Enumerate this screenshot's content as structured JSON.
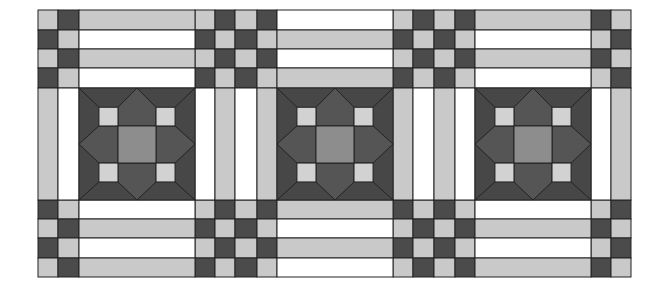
{
  "diagram": {
    "type": "quilt-pattern"
  },
  "colors": {
    "white": "#ffffff",
    "light": "#c9c9c9",
    "dark": "#4b4b4b",
    "block_bg": "#474747",
    "arrow": "#555555",
    "center": "#8d8d8d",
    "small_square": "#d2d2d2",
    "line": "#222222"
  },
  "grid": {
    "x": [
      38,
      58,
      79,
      195,
      215,
      235,
      257,
      277,
      393,
      413,
      434,
      455,
      475,
      591,
      611,
      631
    ],
    "y": [
      10,
      30,
      49,
      68,
      88,
      200,
      219,
      238,
      258,
      277
    ]
  },
  "layout": {
    "four_patch_columns": [
      {
        "name": "left-edge",
        "cols": [
          0,
          1
        ],
        "first_row_pattern": [
          "light",
          "dark"
        ]
      },
      {
        "name": "between-1-2",
        "cols": [
          3,
          4,
          5,
          6
        ],
        "first_row_pattern": [
          "light",
          "dark",
          "light",
          "dark"
        ]
      },
      {
        "name": "between-2-3",
        "cols": [
          8,
          9,
          10,
          11
        ],
        "first_row_pattern": [
          "light",
          "dark",
          "light",
          "dark"
        ]
      },
      {
        "name": "right-edge",
        "cols": [
          13,
          14
        ],
        "first_row_pattern": [
          "dark",
          "light"
        ]
      }
    ],
    "bottom_first_row_pattern_left": [
      "dark",
      "light"
    ],
    "bottom_first_row_pattern_between_1_2": [
      "light",
      "dark",
      "light",
      "dark"
    ],
    "bottom_first_row_pattern_between_2_3": [
      "dark",
      "light",
      "dark",
      "light"
    ],
    "bottom_first_row_pattern_right": [
      "light",
      "dark"
    ],
    "middle_strips": {
      "left-edge": [
        "light",
        "white"
      ],
      "between-1-2": [
        "white",
        "light",
        "white",
        "light"
      ],
      "between-2-3": [
        "light",
        "white",
        "light",
        "white"
      ],
      "right-edge": [
        "white",
        "light"
      ]
    },
    "blocks": [
      {
        "id": 1,
        "x0": 79,
        "x1": 195,
        "top_strips": [
          "light",
          "white",
          "light",
          "white"
        ],
        "bottom_strips": [
          "white",
          "light",
          "white",
          "light"
        ]
      },
      {
        "id": 2,
        "x0": 277,
        "x1": 393,
        "top_strips": [
          "white",
          "light",
          "white",
          "light"
        ],
        "bottom_strips": [
          "light",
          "white",
          "light",
          "white"
        ]
      },
      {
        "id": 3,
        "x0": 475,
        "x1": 591,
        "top_strips": [
          "light",
          "white",
          "light",
          "white"
        ],
        "bottom_strips": [
          "white",
          "light",
          "white",
          "light"
        ]
      }
    ]
  }
}
